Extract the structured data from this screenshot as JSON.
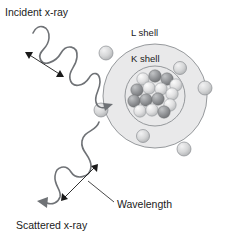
{
  "figure": {
    "background_color": "#ffffff",
    "labels": {
      "incident": "Incident x-ray",
      "scattered": "Scattered x-ray",
      "wavelength": "Wavelength",
      "l_shell": "L shell",
      "k_shell": "K shell"
    },
    "colors": {
      "wave_stroke": "#6f7276",
      "shell_stroke": "#8b8e92",
      "atom_fill": "#e9e9ea",
      "text": "#1a1a1a",
      "electron_fill": "#d2d3d4",
      "nucleon_dark": "#8d8f92",
      "nucleon_light": "#dcdcdd"
    },
    "atom": {
      "center_x": 155,
      "center_y": 96,
      "outer_radius": 52,
      "l_shell_radius": 52,
      "k_shell_radius": 30
    },
    "electrons": [
      {
        "name": "electron-l-upper-left",
        "cx": 106,
        "cy": 53,
        "r": 7,
        "shell": "L"
      },
      {
        "name": "electron-l-left-lower",
        "cx": 101,
        "cy": 110,
        "r": 7,
        "shell": "L"
      },
      {
        "name": "electron-l-right",
        "cx": 205,
        "cy": 88,
        "r": 7,
        "shell": "L"
      },
      {
        "name": "electron-l-lower-right",
        "cx": 184,
        "cy": 149,
        "r": 7,
        "shell": "L"
      },
      {
        "name": "electron-k-upper-right",
        "cx": 180,
        "cy": 68,
        "r": 6.5,
        "shell": "K"
      },
      {
        "name": "electron-k-lower",
        "cx": 143,
        "cy": 136,
        "r": 6.5,
        "shell": "K"
      }
    ],
    "nucleons": [
      {
        "cx": 143,
        "cy": 79,
        "r": 6.2,
        "tone": "light"
      },
      {
        "cx": 155,
        "cy": 76,
        "r": 6.2,
        "tone": "dark"
      },
      {
        "cx": 167,
        "cy": 79,
        "r": 6.2,
        "tone": "dark"
      },
      {
        "cx": 137,
        "cy": 90,
        "r": 6.2,
        "tone": "dark"
      },
      {
        "cx": 149,
        "cy": 88,
        "r": 6.2,
        "tone": "light"
      },
      {
        "cx": 161,
        "cy": 89,
        "r": 6.2,
        "tone": "light"
      },
      {
        "cx": 172,
        "cy": 91,
        "r": 6.2,
        "tone": "light"
      },
      {
        "cx": 134,
        "cy": 101,
        "r": 6.2,
        "tone": "dark"
      },
      {
        "cx": 146,
        "cy": 100,
        "r": 6.2,
        "tone": "dark"
      },
      {
        "cx": 158,
        "cy": 99,
        "r": 6.2,
        "tone": "dark"
      },
      {
        "cx": 170,
        "cy": 102,
        "r": 6.2,
        "tone": "light"
      },
      {
        "cx": 140,
        "cy": 111,
        "r": 6.2,
        "tone": "light"
      },
      {
        "cx": 152,
        "cy": 110,
        "r": 6.2,
        "tone": "light"
      },
      {
        "cx": 164,
        "cy": 112,
        "r": 6.2,
        "tone": "dark"
      },
      {
        "cx": 176,
        "cy": 80,
        "r": 6.2,
        "tone": "light"
      }
    ],
    "waves": {
      "incident": {
        "description": "short-wavelength sine wave travelling down-right into the atom",
        "path": "M 33 33 C 38 22, 50 26, 49 38 C 48 50, 38 50, 40 58 C 42 68, 56 62, 61 53 C 66 44, 78 45, 77 57 C 76 68, 68 70, 70 79 C 72 89, 84 86, 89 78 C 93 71, 100 72, 100 82 C 100 90, 94 95, 96 102 C 97 107, 102 109, 106 107",
        "arrow_tip_x": 112,
        "arrow_tip_y": 104,
        "arrow_angle": -22
      },
      "scattered": {
        "description": "longer-wavelength sine wave leaving down-left from the atom",
        "path": "M 99 122 C 96 132, 84 130, 82 141 C 80 152, 92 156, 91 167 C 90 178, 76 180, 71 172 C 66 164, 56 166, 55 176 C 54 186, 62 190, 60 197 C 58 203, 52 205, 47 203",
        "arrow_tip_x": 38,
        "arrow_tip_y": 203,
        "arrow_angle": 196
      }
    },
    "dimension_arrows": [
      {
        "name": "incident-wavelength-arrow",
        "x1": 27,
        "y1": 53,
        "x2": 62,
        "y2": 76,
        "double_headed": true
      },
      {
        "name": "scattered-wavelength-arrow",
        "x1": 96,
        "y1": 166,
        "x2": 63,
        "y2": 199,
        "double_headed": true
      }
    ],
    "leader_lines": [
      {
        "name": "wavelength-leader",
        "x1": 113,
        "y1": 203,
        "x2": 85,
        "y2": 183
      }
    ],
    "label_positions": {
      "incident": {
        "x": 5,
        "y": 16
      },
      "scattered": {
        "x": 16,
        "y": 228
      },
      "wavelength": {
        "x": 117,
        "y": 208
      },
      "l_shell": {
        "x": 131,
        "y": 36
      },
      "k_shell": {
        "x": 131,
        "y": 61
      }
    }
  }
}
